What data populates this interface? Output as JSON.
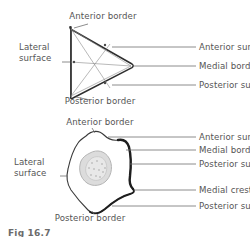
{
  "figure": {
    "caption": "Fig 16.7",
    "accent_outline": "#2b2b2b",
    "leader_line_color": "#6e6e6e",
    "text_color": "#555555",
    "marrow_fill": "#dcdcdc",
    "background": "#ffffff"
  },
  "diagram_top": {
    "name": "upper-triangular-cross-section",
    "shape": "triangle",
    "labels": {
      "top": "Anterior border",
      "bottom": "Posterior border",
      "left_line1": "Lateral",
      "left_line2": "surface",
      "right_1": "Anterior surface",
      "right_2": "Medial border",
      "right_3": "Posterior surface"
    }
  },
  "diagram_bottom": {
    "name": "lower-irregular-cross-section",
    "shape": "irregular",
    "labels": {
      "top": "Anterior border",
      "bottom": "Posterior border",
      "left_line1": "Lateral",
      "left_line2": "surface",
      "right_1": "Anterior surface",
      "right_2": "Medial border",
      "right_3": "Posterior surface",
      "right_4": "Medial crest",
      "right_5": "Posterior surface"
    }
  }
}
